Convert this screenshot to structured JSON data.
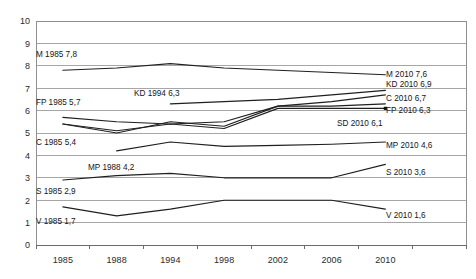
{
  "chart_data": {
    "type": "line",
    "title": "",
    "subtitle": "",
    "xlabel": "",
    "ylabel": "",
    "grid": true,
    "legend": "inline-annotations",
    "x": [
      "1985",
      "1988",
      "1994",
      "1998",
      "2002",
      "2006",
      "2010"
    ],
    "xlim": [
      0,
      8
    ],
    "ylim": [
      0,
      10
    ],
    "yticks": [
      "0",
      "1",
      "2",
      "3",
      "4",
      "5",
      "6",
      "7",
      "8",
      "9",
      "10"
    ],
    "series": [
      {
        "name": "M",
        "x": [
          "1985",
          "1988",
          "1994",
          "1998",
          "2002",
          "2006",
          "2010"
        ],
        "values": [
          7.8,
          7.9,
          8.1,
          7.9,
          7.8,
          7.7,
          7.6
        ]
      },
      {
        "name": "KD",
        "x": [
          "1994",
          "1998",
          "2002",
          "2006",
          "2010"
        ],
        "values": [
          6.3,
          6.4,
          6.5,
          6.7,
          6.9
        ]
      },
      {
        "name": "C",
        "x": [
          "1985",
          "1988",
          "1994",
          "1998",
          "2002",
          "2006",
          "2010"
        ],
        "values": [
          5.4,
          5.0,
          5.5,
          5.3,
          6.2,
          6.4,
          6.7
        ]
      },
      {
        "name": "FP",
        "x": [
          "1985",
          "1988",
          "1994",
          "1998",
          "2002",
          "2006",
          "2010"
        ],
        "values": [
          5.7,
          5.5,
          5.4,
          5.5,
          6.2,
          6.2,
          6.3
        ]
      },
      {
        "name": "SD",
        "x": [
          "1985",
          "1988",
          "1994",
          "1998",
          "2002",
          "2006",
          "2010"
        ],
        "values": [
          5.4,
          5.1,
          5.4,
          5.2,
          6.1,
          6.1,
          6.1
        ]
      },
      {
        "name": "MP",
        "x": [
          "1988",
          "1994",
          "1998",
          "2002",
          "2006",
          "2010"
        ],
        "values": [
          4.2,
          4.6,
          4.4,
          4.45,
          4.5,
          4.6
        ]
      },
      {
        "name": "S",
        "x": [
          "1985",
          "1988",
          "1994",
          "1998",
          "2002",
          "2006",
          "2010"
        ],
        "values": [
          2.9,
          3.1,
          3.2,
          3.0,
          3.0,
          3.0,
          3.6
        ]
      },
      {
        "name": "V",
        "x": [
          "1985",
          "1988",
          "1994",
          "1998",
          "2002",
          "2006",
          "2010"
        ],
        "values": [
          1.7,
          1.3,
          1.6,
          2.0,
          2.0,
          2.0,
          1.6
        ]
      }
    ],
    "annotations": [
      {
        "id": "m-start",
        "text": "M 1985 7,8",
        "series": "M",
        "anchor": "start"
      },
      {
        "id": "fp-start",
        "text": "FP 1985 5,7",
        "series": "FP",
        "anchor": "start"
      },
      {
        "id": "kd-start",
        "text": "KD 1994 6,3",
        "series": "KD",
        "anchor": "start"
      },
      {
        "id": "c-start",
        "text": "C 1985 5,4",
        "series": "C",
        "anchor": "start"
      },
      {
        "id": "mp-start",
        "text": "MP 1988 4,2",
        "series": "MP",
        "anchor": "start"
      },
      {
        "id": "s-start",
        "text": "S 1985 2,9",
        "series": "S",
        "anchor": "start"
      },
      {
        "id": "v-start",
        "text": "V 1985 1,7",
        "series": "V",
        "anchor": "start"
      },
      {
        "id": "m-end",
        "text": "M 2010 7,6",
        "series": "M",
        "anchor": "end"
      },
      {
        "id": "kd-end",
        "text": "KD 2010 6,9",
        "series": "KD",
        "anchor": "end"
      },
      {
        "id": "c-end",
        "text": "C 2010 6,7",
        "series": "C",
        "anchor": "end"
      },
      {
        "id": "fp-end",
        "text": "FP 2010 6,3",
        "series": "FP",
        "anchor": "end"
      },
      {
        "id": "sd-end",
        "text": "SD 2010 6,1",
        "series": "SD",
        "anchor": "end"
      },
      {
        "id": "mp-end",
        "text": "MP 2010 4,6",
        "series": "MP",
        "anchor": "end"
      },
      {
        "id": "s-end",
        "text": "S 2010 3,6",
        "series": "S",
        "anchor": "end"
      },
      {
        "id": "v-end",
        "text": "V 2010 1,6",
        "series": "V",
        "anchor": "end"
      }
    ],
    "colors": {
      "line": "#1f1f1f",
      "grid": "#a6a6a6",
      "frame": "#8f8f8f",
      "text": "#151515"
    }
  }
}
